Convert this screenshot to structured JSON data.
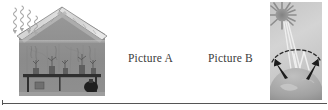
{
  "page": {
    "background_color": "#ffffff",
    "width": 328,
    "height": 110
  },
  "captions": {
    "picture_a": "Picture A",
    "picture_b": "Picture B"
  },
  "figure_a": {
    "name": "greenhouse-illustration",
    "description": "Cross-section of a greenhouse with glass roof, plants on a bench, and wavy radiation arrows entering through the roof",
    "elements": {
      "roof": "glass-roof",
      "wall": "interior-wall",
      "bench": "plant-bench",
      "plants": "potted-plants",
      "incoming_rays": "wavy-arrows"
    },
    "palette": {
      "frame": "#9c9c9c",
      "wall": "#8d8d8d",
      "roof_glass": "#d9d9d9",
      "bench": "#3a3a3a",
      "rays": "#b5b5b5"
    }
  },
  "figure_b": {
    "name": "greenhouse-effect-illustration",
    "description": "The sun radiating light onto a curved Earth surface, with a dashed atmosphere layer and black arrows showing reflected heat trapped below",
    "elements": {
      "sun": "sun-icon",
      "sky": "sky-background",
      "atmosphere": "dashed-atmosphere-arc",
      "earth": "earth-dome",
      "incoming_rays": "sun-rays",
      "reflected_arrows": "upward-black-arrows"
    },
    "palette": {
      "sky": "#cfcfcf",
      "sun": "#8f8f8f",
      "earth": "#a6a6a6",
      "arrows": "#1c1c1c",
      "rays": "#eeeeee"
    }
  },
  "divider": {
    "name": "horizontal-rule",
    "color": "#555555"
  }
}
